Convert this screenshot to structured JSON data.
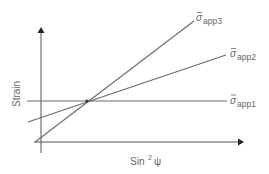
{
  "diagram": {
    "x_axis_label": "Sin",
    "x_axis_superscript": "2",
    "x_axis_symbol": "ψ",
    "y_axis_label": "Strain",
    "lines": [
      {
        "id": "app1",
        "symbol": "σ",
        "subscript": "app1",
        "slope": "zero"
      },
      {
        "id": "app2",
        "symbol": "σ",
        "subscript": "app2",
        "slope": "medium"
      },
      {
        "id": "app3",
        "symbol": "σ",
        "subscript": "app3",
        "slope": "steep"
      }
    ],
    "colors": {
      "lines": "#6a6a6a",
      "axes": "#555555",
      "text": "#666666"
    }
  }
}
